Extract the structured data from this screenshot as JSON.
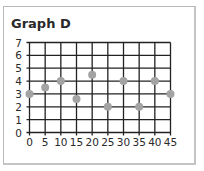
{
  "chart_data": {
    "type": "scatter",
    "title": "Graph D",
    "xlabel": "",
    "ylabel": "",
    "x": [
      0,
      5,
      10,
      15,
      20,
      25,
      30,
      35,
      40,
      45
    ],
    "y": [
      3,
      3.5,
      4,
      2.6,
      4.5,
      2,
      4,
      2,
      4,
      3
    ],
    "xlim": [
      0,
      45
    ],
    "ylim": [
      0,
      7
    ],
    "x_ticks": [
      0,
      5,
      10,
      15,
      20,
      25,
      30,
      35,
      40,
      45
    ],
    "y_ticks": [
      0,
      1,
      2,
      3,
      4,
      5,
      6,
      7
    ],
    "grid": true,
    "legend": null,
    "colors": {
      "marker": "#a3a3a3",
      "grid": "#222222",
      "border": "#bdbdbd"
    }
  }
}
